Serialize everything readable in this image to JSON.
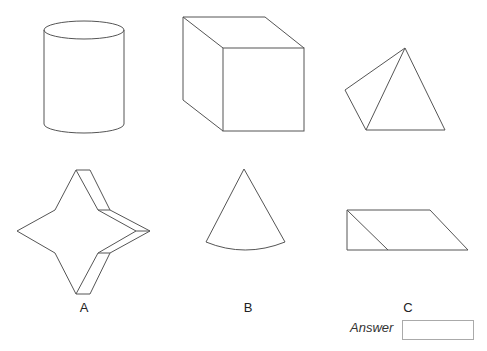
{
  "figure": {
    "shapes": [
      {
        "id": "cylinder",
        "position": "top-left"
      },
      {
        "id": "cube",
        "position": "top-center"
      },
      {
        "id": "tetrahedron",
        "position": "top-right"
      },
      {
        "id": "star-prism",
        "position": "bottom-left",
        "option": "A"
      },
      {
        "id": "cone",
        "position": "bottom-center",
        "option": "B"
      },
      {
        "id": "triangular-prism",
        "position": "bottom-right",
        "option": "C"
      }
    ],
    "stroke_color": "#555555"
  },
  "options": {
    "a": "A",
    "b": "B",
    "c": "C"
  },
  "answer": {
    "label": "Answer",
    "value": ""
  }
}
